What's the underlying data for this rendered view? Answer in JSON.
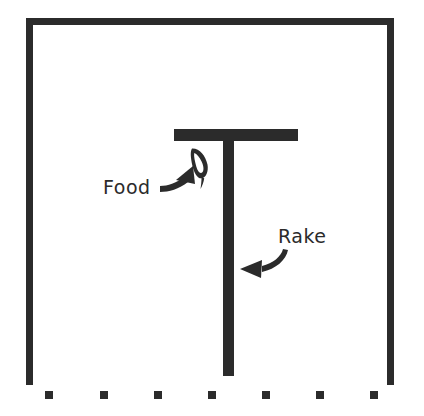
{
  "diagram": {
    "background_color": "#ffffff",
    "ink_color": "#2b2b2b",
    "enclosure": {
      "name": "apparatus-boundary",
      "left": 26,
      "top": 18,
      "right": 394,
      "bottom": 385,
      "stroke_width": 7,
      "open_side": "bottom"
    },
    "dotted_edge": {
      "name": "dotted-front-edge",
      "dot_size": 8,
      "dot_y": 391,
      "dot_x_positions": [
        49,
        104,
        158,
        212,
        266,
        320,
        374
      ],
      "count": 7
    },
    "rake": {
      "name": "rake",
      "head": {
        "x": 174,
        "y": 129,
        "width": 124,
        "height": 12
      },
      "handle": {
        "x": 223,
        "y": 129,
        "width": 11,
        "height": 247
      }
    },
    "food": {
      "name": "food-pellet",
      "center_x": 199,
      "center_y": 162,
      "rotation_deg": -28
    },
    "annotations": [
      {
        "id": "food",
        "label": "Food",
        "label_x": 103,
        "label_y": 179,
        "arrow_name": "food-callout-arrow",
        "arrow_direction": "up-right",
        "points_to": "food-pellet"
      },
      {
        "id": "rake",
        "label": "Rake",
        "label_x": 278,
        "label_y": 228,
        "arrow_name": "rake-callout-arrow",
        "arrow_direction": "left",
        "points_to": "rake-handle"
      }
    ]
  }
}
